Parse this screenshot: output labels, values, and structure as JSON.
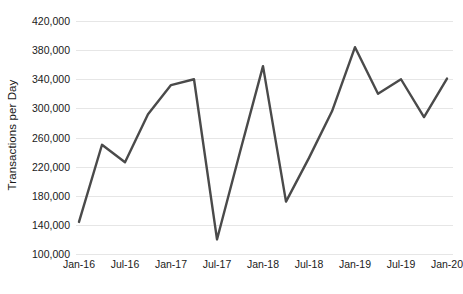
{
  "chart_data": {
    "type": "line",
    "title": "",
    "subtitle": "",
    "xlabel": "",
    "ylabel": "Transactions per Day",
    "ylim": [
      100000,
      420000
    ],
    "ytick_labels": [
      "420,000",
      "380,000",
      "340,000",
      "300,000",
      "260,000",
      "220,000",
      "180,000",
      "140,000",
      "100,000"
    ],
    "ytick_values": [
      420000,
      380000,
      340000,
      300000,
      260000,
      220000,
      180000,
      140000,
      100000
    ],
    "xtick_labels": [
      "Jan-16",
      "Jul-16",
      "Jan-17",
      "Jul-17",
      "Jan-18",
      "Jul-18",
      "Jan-19",
      "Jul-19",
      "Jan-20"
    ],
    "grid": "horizontal",
    "legend": "none",
    "series": [
      {
        "name": "Transactions per Day",
        "color": "#4a4a4a",
        "x": [
          "Jan-16",
          "Apr-16",
          "Jul-16",
          "Oct-16",
          "Jan-17",
          "Apr-17",
          "Jul-17",
          "Oct-17",
          "Jan-18",
          "Apr-18",
          "Jul-18",
          "Oct-18",
          "Jan-19",
          "Apr-19",
          "Jul-19",
          "Oct-19",
          "Jan-20"
        ],
        "values": [
          144000,
          250000,
          226000,
          292000,
          332000,
          340000,
          120000,
          240000,
          358000,
          172000,
          232000,
          296000,
          384000,
          320000,
          340000,
          288000,
          341000
        ]
      }
    ],
    "axis_colors": {
      "gridline": "#e6e6e6",
      "text": "#1a1a1a",
      "line": "#4a4a4a",
      "background": "#ffffff"
    }
  }
}
